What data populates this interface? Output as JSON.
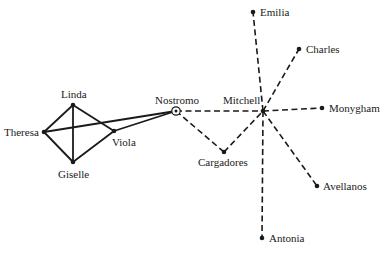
{
  "diagram": {
    "type": "social-network",
    "nodes": [
      {
        "id": "linda",
        "label": "Linda",
        "x": 73,
        "y": 105,
        "style": "dot",
        "label_x": 61,
        "label_y": 98
      },
      {
        "id": "theresa",
        "label": "Theresa",
        "x": 44,
        "y": 132,
        "style": "dot",
        "label_x": 4,
        "label_y": 136
      },
      {
        "id": "giselle",
        "label": "Giselle",
        "x": 73,
        "y": 162,
        "style": "dot",
        "label_x": 58,
        "label_y": 178
      },
      {
        "id": "viola",
        "label": "Viola",
        "x": 114,
        "y": 131,
        "style": "dot",
        "label_x": 112,
        "label_y": 146
      },
      {
        "id": "nostromo",
        "label": "Nostromo",
        "x": 176,
        "y": 111,
        "style": "ring",
        "label_x": 155,
        "label_y": 104
      },
      {
        "id": "mitchell",
        "label": "Mitchell",
        "x": 263,
        "y": 111,
        "style": "dot",
        "label_x": 223,
        "label_y": 104
      },
      {
        "id": "cargadores",
        "label": "Cargadores",
        "x": 224,
        "y": 152,
        "style": "dot",
        "label_x": 198,
        "label_y": 166
      },
      {
        "id": "emilia",
        "label": "Emilia",
        "x": 253,
        "y": 12,
        "style": "dot",
        "label_x": 260,
        "label_y": 16
      },
      {
        "id": "charles",
        "label": "Charles",
        "x": 299,
        "y": 49,
        "style": "dot",
        "label_x": 306,
        "label_y": 53
      },
      {
        "id": "monygham",
        "label": "Monygham",
        "x": 322,
        "y": 108,
        "style": "dot",
        "label_x": 329,
        "label_y": 112
      },
      {
        "id": "avellanos",
        "label": "Avellanos",
        "x": 317,
        "y": 186,
        "style": "dot",
        "label_x": 323,
        "label_y": 190
      },
      {
        "id": "antonia",
        "label": "Antonia",
        "x": 262,
        "y": 238,
        "style": "dot",
        "label_x": 269,
        "label_y": 242
      }
    ],
    "edges": [
      {
        "from": "linda",
        "to": "theresa",
        "style": "solid"
      },
      {
        "from": "linda",
        "to": "giselle",
        "style": "solid"
      },
      {
        "from": "linda",
        "to": "viola",
        "style": "solid"
      },
      {
        "from": "theresa",
        "to": "giselle",
        "style": "solid"
      },
      {
        "from": "theresa",
        "to": "nostromo",
        "style": "solid"
      },
      {
        "from": "giselle",
        "to": "viola",
        "style": "solid"
      },
      {
        "from": "viola",
        "to": "nostromo",
        "style": "solid"
      },
      {
        "from": "nostromo",
        "to": "mitchell",
        "style": "dashed"
      },
      {
        "from": "nostromo",
        "to": "cargadores",
        "style": "dashed"
      },
      {
        "from": "cargadores",
        "to": "mitchell",
        "style": "dashed"
      },
      {
        "from": "mitchell",
        "to": "emilia",
        "style": "dashed"
      },
      {
        "from": "mitchell",
        "to": "charles",
        "style": "dashed"
      },
      {
        "from": "mitchell",
        "to": "monygham",
        "style": "dashed"
      },
      {
        "from": "mitchell",
        "to": "avellanos",
        "style": "dashed"
      },
      {
        "from": "mitchell",
        "to": "antonia",
        "style": "dashed"
      }
    ],
    "colors": {
      "ink": "#1a1a1a",
      "background": "#ffffff"
    }
  }
}
